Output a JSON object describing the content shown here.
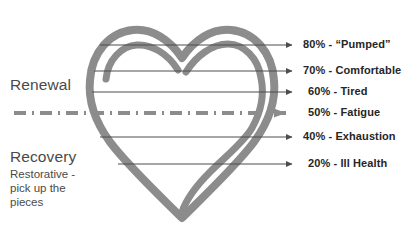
{
  "diagram": {
    "title_zones": {
      "renewal": "Renewal",
      "recovery": "Recovery",
      "recovery_subtitle": "Restorative - pick up the pieces"
    },
    "colors": {
      "heart_stroke": "#8c8c8c",
      "line": "#4d4d4d",
      "text_dark": "#262626",
      "text_zone": "#4a4a4a",
      "highlight_arrow": "#8c8c8c",
      "background": "#ffffff"
    },
    "divider": {
      "style": "dash-dot",
      "level_percent": "50%"
    },
    "stages": [
      {
        "percent": "80%",
        "separator": "-",
        "name": "“Pumped”",
        "label": "80% - “Pumped”",
        "y": 45,
        "highlight": false
      },
      {
        "percent": "70%",
        "separator": "-",
        "name": "Comfortable",
        "label": "70% - Comfortable",
        "y": 71,
        "highlight": false
      },
      {
        "percent": "60%",
        "separator": "-",
        "name": "Tired",
        "label": "60% - Tired",
        "y": 92,
        "highlight": false
      },
      {
        "percent": "50%",
        "separator": "-",
        "name": "Fatigue",
        "label": "50% - Fatigue",
        "y": 113,
        "highlight": true
      },
      {
        "percent": "40%",
        "separator": "-",
        "name": "Exhaustion",
        "label": "40% - Exhaustion",
        "y": 137,
        "highlight": false
      },
      {
        "percent": "20%",
        "separator": "-",
        "name": "Ill Health",
        "label": "20% - Ill Health",
        "y": 164,
        "highlight": false
      }
    ]
  }
}
